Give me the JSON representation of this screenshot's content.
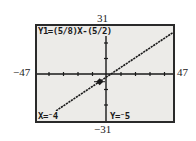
{
  "window": {
    "ymax": "31",
    "ymin": "−31",
    "xmin": "−47",
    "xmax": "47",
    "xscl": 10,
    "yscl": 10
  },
  "screen": {
    "equation": "Y1=(5/8)X-(5/2)",
    "trace_x": "X=⁻4",
    "trace_y": "Y=⁻5"
  },
  "graph": {
    "function": "y = (5/8)x - 5/2",
    "slope": 0.625,
    "intercept": -2.5,
    "cursor": {
      "x": -4,
      "y": -5
    },
    "colors": {
      "background": "#ecebe8",
      "ink": "#1a1a1a",
      "border": "#2a2a2a"
    }
  }
}
